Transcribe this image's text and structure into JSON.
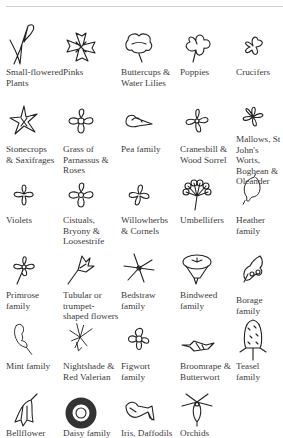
{
  "page": {
    "items": [
      {
        "label": "Small-flowered\nPlants",
        "icon": "small-flowered-plant-icon"
      },
      {
        "label": "Pinks",
        "icon": "pink-flower-icon"
      },
      {
        "label": "Buttercups &\nWater Lilies",
        "icon": "buttercup-icon"
      },
      {
        "label": "Poppies",
        "icon": "poppy-icon"
      },
      {
        "label": "Crucifers",
        "icon": "crucifer-icon"
      },
      {
        "label": "Stonecrops\n& Saxifrages",
        "icon": "stonecrop-icon"
      },
      {
        "label": "Grass of\nParnassus &\nRoses",
        "icon": "rose-icon"
      },
      {
        "label": "Pea family",
        "icon": "pea-flower-icon"
      },
      {
        "label": "Cranesbill &\nWood Sorrel",
        "icon": "cranesbill-icon"
      },
      {
        "label": "Mallows, St\nJohn's Worts,\nBogbean &\nOleander",
        "icon": "mallow-icon"
      },
      {
        "label": "Violets",
        "icon": "violet-icon"
      },
      {
        "label": "Cistuals,\nBryony &\nLoosestrife",
        "icon": "cistus-icon"
      },
      {
        "label": "Willowherbs\n& Cornels",
        "icon": "willowherb-icon"
      },
      {
        "label": "Umbellifers",
        "icon": "umbellifer-icon"
      },
      {
        "label": "Heather\nfamily",
        "icon": "heather-bell-icon"
      },
      {
        "label": "Primrose\nfamily",
        "icon": "primrose-icon"
      },
      {
        "label": "Tubular or\ntrumpet-\nshaped flowers",
        "icon": "tubular-flower-icon"
      },
      {
        "label": "Bedstraw\nfamily",
        "icon": "bedstraw-star-icon"
      },
      {
        "label": "Bindweed\nfamily",
        "icon": "bindweed-trumpet-icon"
      },
      {
        "label": "Borage family",
        "icon": "borage-icon"
      },
      {
        "label": "Mint family",
        "icon": "mint-lipped-icon"
      },
      {
        "label": "Nightshade &\nRed Valerian",
        "icon": "nightshade-icon"
      },
      {
        "label": "Figwort\nfamily",
        "icon": "figwort-icon"
      },
      {
        "label": "Broomrape &\nButterwort",
        "icon": "broomrape-icon"
      },
      {
        "label": "Teasel\nfamily",
        "icon": "teasel-icon"
      },
      {
        "label": "Bellflower",
        "icon": "bellflower-icon"
      },
      {
        "label": "Daisy family",
        "icon": "daisy-icon"
      },
      {
        "label": "Iris, Daffodils",
        "icon": "iris-icon"
      },
      {
        "label": "Orchids",
        "icon": "orchid-icon"
      }
    ]
  }
}
